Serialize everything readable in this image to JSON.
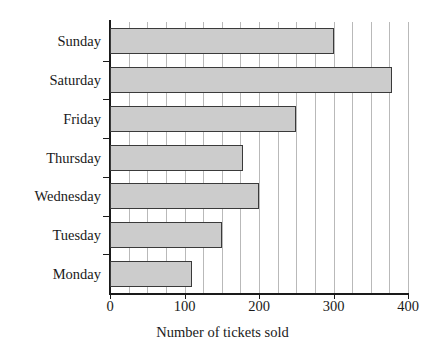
{
  "chart_data": {
    "type": "bar",
    "orientation": "horizontal",
    "title": "",
    "xlabel": "Number of tickets sold",
    "ylabel": "",
    "categories": [
      "Monday",
      "Tuesday",
      "Wednesday",
      "Thursday",
      "Friday",
      "Saturday",
      "Sunday"
    ],
    "values": [
      110,
      150,
      200,
      178,
      250,
      378,
      300
    ],
    "xlim": [
      0,
      400
    ],
    "xticks": [
      0,
      100,
      200,
      300,
      400
    ],
    "xtick_labels": [
      "0",
      "100",
      "200",
      "300",
      "400"
    ],
    "gridline_step": 25,
    "grid": true,
    "legend": null,
    "bar_fill_color": "#cccccc",
    "bar_border_color": "#3a3a3a",
    "gridline_color": "#b9b9b9",
    "axis_color": "#1a1a1a",
    "background_color": "#ffffff"
  }
}
